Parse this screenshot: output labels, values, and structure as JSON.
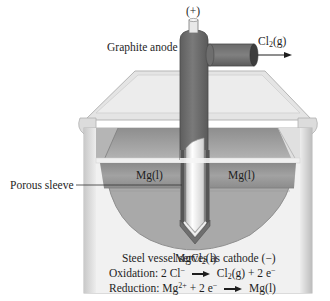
{
  "labels": {
    "polarity": "(+)",
    "anode": "Graphite anode",
    "gas_product": {
      "base": "Cl",
      "sub": "2",
      "tail": "(g)"
    },
    "sleeve": "Porous sleeve",
    "mg_left": "Mg(l)",
    "mg_right": "Mg(l)",
    "electrolyte": {
      "base": "MgCl",
      "sub": "2",
      "tail": "(l)"
    },
    "cathode_note": "Steel vessel serves as cathode (−)"
  },
  "equations": {
    "oxidation": {
      "label": "Oxidation:",
      "reactant": "2 Cl",
      "reactant_charge": "−",
      "product_base": "Cl",
      "product_sub": "2",
      "product_tail": "(g) + 2 e",
      "product_charge": "−"
    },
    "reduction": {
      "label": "Reduction:",
      "reactant_base": "Mg",
      "reactant_charge": "2+",
      "reactant_tail": " + 2 e",
      "reactant_tail_charge": "−",
      "product": "Mg(l)"
    }
  },
  "colors": {
    "anode_gray": "#6f6f6f",
    "anode_dark": "#555555",
    "vessel_light": "#e9e9e9",
    "vessel_mid": "#cfcfcf",
    "mg_layer": "#9a9a9a",
    "melt_bowl": "#a8a8a8",
    "sleeve_white": "#f4f4f4"
  }
}
